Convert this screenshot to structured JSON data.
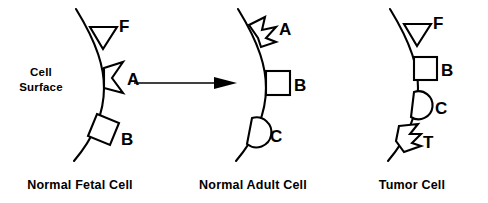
{
  "figure": {
    "background_color": "#ffffff",
    "ink_color": "#000000",
    "surface_label_line1": "Cell",
    "surface_label_line2": "Surface",
    "transition_arrow": "right-arrow"
  },
  "panels": [
    {
      "id": "normal-fetal-cell",
      "caption": "Normal Fetal Cell",
      "markers": [
        {
          "label": "F",
          "shape": "triangle"
        },
        {
          "label": "A",
          "shape": "notched-chevron"
        },
        {
          "label": "B",
          "shape": "tilted-square"
        }
      ]
    },
    {
      "id": "normal-adult-cell",
      "caption": "Normal Adult Cell",
      "markers": [
        {
          "label": "A",
          "shape": "jagged-star"
        },
        {
          "label": "B",
          "shape": "square"
        },
        {
          "label": "C",
          "shape": "semicircle"
        }
      ]
    },
    {
      "id": "tumor-cell",
      "caption": "Tumor Cell",
      "markers": [
        {
          "label": "F",
          "shape": "triangle"
        },
        {
          "label": "B",
          "shape": "square"
        },
        {
          "label": "C",
          "shape": "semicircle"
        },
        {
          "label": "T",
          "shape": "jagged-zigzag"
        }
      ]
    }
  ]
}
